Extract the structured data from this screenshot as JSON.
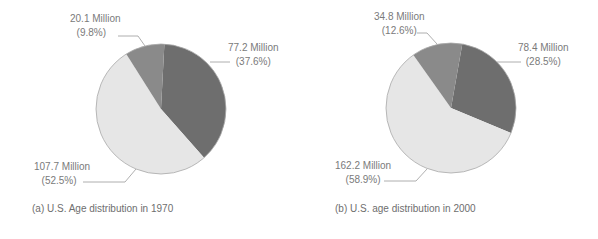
{
  "chart_data": [
    {
      "type": "pie",
      "title": "(a) U.S. Age distribution in 1970",
      "categories": [
        "Slice A (dark)",
        "Slice B (light)",
        "Slice C (medium)"
      ],
      "values_millions": [
        77.2,
        107.7,
        20.1
      ],
      "percentages": [
        37.6,
        52.5,
        9.8
      ],
      "labels": [
        {
          "value": "77.2 Million",
          "pct": "(37.6%)"
        },
        {
          "value": "107.7 Million",
          "pct": "(52.5%)"
        },
        {
          "value": "20.1 Million",
          "pct": "(9.8%)"
        }
      ],
      "start_angle_deg": 3,
      "colors": [
        "#6e6e6e",
        "#e6e6e6",
        "#8a8a8a"
      ],
      "legend": "none",
      "grid": false
    },
    {
      "type": "pie",
      "title": "(b) U.S. age distribution in 2000",
      "categories": [
        "Slice A (dark)",
        "Slice B (light)",
        "Slice C (medium)"
      ],
      "values_millions": [
        78.4,
        162.2,
        34.8
      ],
      "percentages": [
        28.5,
        58.9,
        12.6
      ],
      "labels": [
        {
          "value": "78.4 Million",
          "pct": "(28.5%)"
        },
        {
          "value": "162.2 Million",
          "pct": "(58.9%)"
        },
        {
          "value": "34.8 Million",
          "pct": "(12.6%)"
        }
      ],
      "start_angle_deg": 10,
      "colors": [
        "#6e6e6e",
        "#e6e6e6",
        "#8a8a8a"
      ],
      "legend": "none",
      "grid": false
    }
  ],
  "figures": [
    {
      "caption": "(a) U.S. Age distribution in 1970",
      "dark_label": {
        "value": "77.2 Million",
        "pct": "(37.6%)"
      },
      "light_label": {
        "value": "107.7 Million",
        "pct": "(52.5%)"
      },
      "medium_label": {
        "value": "20.1 Million",
        "pct": "(9.8%)"
      }
    },
    {
      "caption": "(b) U.S. age distribution in 2000",
      "dark_label": {
        "value": "78.4 Million",
        "pct": "(28.5%)"
      },
      "light_label": {
        "value": "162.2 Million",
        "pct": "(58.9%)"
      },
      "medium_label": {
        "value": "34.8 Million",
        "pct": "(12.6%)"
      }
    }
  ]
}
